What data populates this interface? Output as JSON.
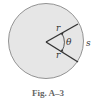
{
  "diagram": {
    "labels": {
      "radius_top": "r",
      "radius_bottom": "r",
      "angle": "θ",
      "arc": "s"
    },
    "colors": {
      "circle_fill": "#e6e6e6",
      "circle_stroke": "#7a7a7a",
      "radius_stroke": "#333333"
    }
  },
  "caption": "Fig. A–3"
}
